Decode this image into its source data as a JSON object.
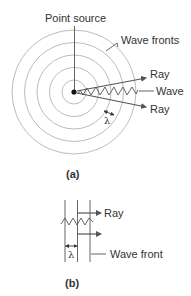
{
  "figure_a": {
    "caption": "(a)",
    "labels": {
      "point_source": "Point source",
      "wave_fronts": "Wave fronts",
      "ray_upper": "Ray",
      "wave": "Wave",
      "ray_lower": "Ray",
      "wavelength": "λ"
    },
    "wave_front_count": 5
  },
  "figure_b": {
    "caption": "(b)",
    "labels": {
      "ray": "Ray",
      "wave_front": "Wave front",
      "wavelength": "λ"
    },
    "wave_front_count": 3
  },
  "colors": {
    "circles": "#b4b4b4",
    "lines": "#555555",
    "text": "#333333",
    "dot": "#111111"
  }
}
